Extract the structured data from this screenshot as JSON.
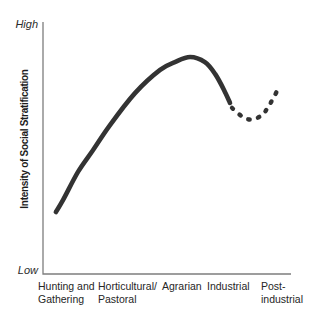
{
  "labels": {
    "high": "High",
    "low": "Low",
    "y_axis_title": "Intensity of Social Stratification",
    "x_axis": [
      {
        "line1": "Hunting and",
        "line2": "Gathering"
      },
      {
        "line1": "Horticultural/",
        "line2": "Pastoral"
      },
      {
        "line1": "Agrarian",
        "line2": ""
      },
      {
        "line1": "Industrial",
        "line2": ""
      },
      {
        "line1": "Post-",
        "line2": "industrial"
      }
    ]
  },
  "chart_data": {
    "type": "line",
    "title": "",
    "xlabel": "",
    "ylabel": "Intensity of Social Stratification",
    "y_axis_range_labels": {
      "top": "High",
      "bottom": "Low"
    },
    "categories": [
      "Hunting and Gathering",
      "Horticultural/Pastoral",
      "Agrarian",
      "Industrial",
      "Post-industrial"
    ],
    "grid": false,
    "legend": false,
    "units": "points are [fraction along x-axis, intensity where 0 = Low and 1 = High]",
    "series": [
      {
        "name": "solid curve (rising then falling stratification)",
        "line_style": "solid",
        "intensity_at_categories": {
          "Hunting and Gathering": 0.27,
          "Horticultural/Pastoral": 0.66,
          "Agrarian": 0.85,
          "Industrial": 0.7
        },
        "peak_intensity": 0.86,
        "points": [
          [
            0.052,
            0.246
          ],
          [
            0.081,
            0.294
          ],
          [
            0.141,
            0.405
          ],
          [
            0.202,
            0.492
          ],
          [
            0.27,
            0.591
          ],
          [
            0.371,
            0.718
          ],
          [
            0.472,
            0.81
          ],
          [
            0.532,
            0.841
          ],
          [
            0.593,
            0.861
          ],
          [
            0.653,
            0.841
          ],
          [
            0.694,
            0.794
          ],
          [
            0.73,
            0.73
          ],
          [
            0.754,
            0.679
          ]
        ]
      },
      {
        "name": "dashed curve (dip then rise at post-industrial)",
        "line_style": "dashed",
        "intensity_at_categories": {
          "Post-industrial": 0.73
        },
        "dip_intensity": 0.61,
        "points": [
          [
            0.762,
            0.659
          ],
          [
            0.806,
            0.623
          ],
          [
            0.843,
            0.613
          ],
          [
            0.883,
            0.631
          ],
          [
            0.911,
            0.667
          ],
          [
            0.944,
            0.726
          ]
        ]
      }
    ],
    "style": {
      "curve_color": "#333333",
      "axis_color": "#7d7d7d",
      "background": "#ffffff",
      "text_color": "#262626"
    }
  }
}
